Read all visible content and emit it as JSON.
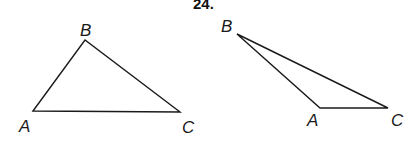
{
  "problem": {
    "number": "24."
  },
  "figures": [
    {
      "name": "triangle-left",
      "vertices": {
        "A": {
          "label": "A",
          "x": 33,
          "y": 111
        },
        "B": {
          "label": "B",
          "x": 85,
          "y": 40
        },
        "C": {
          "label": "C",
          "x": 180,
          "y": 112
        }
      }
    },
    {
      "name": "triangle-right",
      "vertices": {
        "A": {
          "label": "A",
          "x": 320,
          "y": 108
        },
        "B": {
          "label": "B",
          "x": 237,
          "y": 34
        },
        "C": {
          "label": "C",
          "x": 388,
          "y": 108
        }
      }
    }
  ],
  "colors": {
    "ink": "#1a1a1a",
    "background": "#ffffff"
  }
}
